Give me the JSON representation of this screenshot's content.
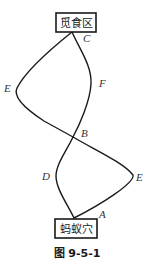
{
  "figure": {
    "caption": "图 9-5-1",
    "boxes": {
      "top": "觅食区",
      "bottom": "蚂蚁穴"
    },
    "points": {
      "A": "A",
      "B": "B",
      "C": "C",
      "D": "D",
      "E_left": "E",
      "E_right": "E",
      "F": "F"
    },
    "colors": {
      "line": "#1a1a1a",
      "background": "#ffffff"
    }
  }
}
